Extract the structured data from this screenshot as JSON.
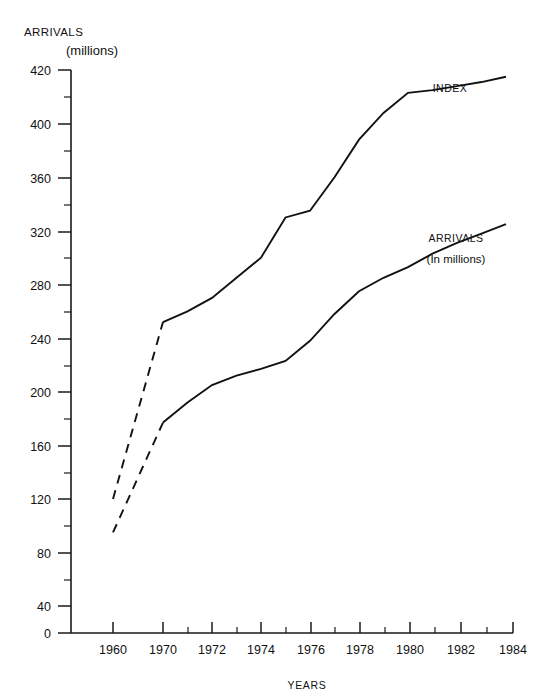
{
  "chart_data": {
    "type": "line",
    "title": "ARRIVALS",
    "subtitle": "(millions)",
    "xlabel": "YEARS",
    "ylabel": "",
    "ylim": [
      0,
      420
    ],
    "grid": false,
    "legend_position": "inline-annotation",
    "y_ticks_major": [
      0,
      40,
      80,
      120,
      160,
      200,
      240,
      280,
      320,
      360,
      400,
      420
    ],
    "y_ticks_minor": [
      20,
      60,
      100,
      140,
      180,
      220,
      260,
      300,
      340,
      380
    ],
    "x_ticks_major": [
      1960,
      1970,
      1972,
      1974,
      1976,
      1978,
      1980,
      1982,
      1984
    ],
    "x_ticks_minor": [
      1971,
      1973,
      1975,
      1977,
      1979,
      1981,
      1983
    ],
    "x_axis_note": "broken axis between 1960 and 1970",
    "series": [
      {
        "name": "INDEX",
        "label": "INDEX",
        "sublabel": "",
        "style": "solid-with-dashed-head",
        "x": [
          1960,
          1970,
          1971,
          1972,
          1973,
          1974,
          1975,
          1976,
          1977,
          1978,
          1979,
          1980,
          1981,
          1982,
          1983,
          1984
        ],
        "values": [
          100,
          232,
          240,
          250,
          265,
          280,
          310,
          315,
          340,
          368,
          388,
          403,
          405,
          408,
          411,
          415
        ],
        "dashed_through": 1970
      },
      {
        "name": "ARRIVALS",
        "label": "ARRIVALS",
        "sublabel": "(In millions)",
        "style": "solid-with-dashed-head",
        "x": [
          1960,
          1970,
          1971,
          1972,
          1973,
          1974,
          1975,
          1976,
          1977,
          1978,
          1979,
          1980,
          1981,
          1982,
          1983,
          1984
        ],
        "values": [
          75,
          157,
          172,
          185,
          192,
          197,
          203,
          218,
          238,
          255,
          265,
          273,
          283,
          291,
          298,
          305
        ],
        "dashed_through": 1970
      }
    ],
    "annotations": [
      {
        "text": "INDEX",
        "x": 1981,
        "y": 418
      },
      {
        "text": "ARRIVALS",
        "x": 1981.4,
        "y": 312
      },
      {
        "text": "(In millions)",
        "x": 1981.4,
        "y": 295
      }
    ],
    "colors": {
      "line": "#111111",
      "axis": "#1a1a1a",
      "background": "#ffffff"
    }
  },
  "labels": {
    "axis_title_main": "ARRIVALS",
    "axis_title_sub": "(millions)",
    "x_axis_title": "YEARS",
    "index_label": "INDEX",
    "arrivals_label": "ARRIVALS",
    "arrivals_sublabel": "(In millions)"
  },
  "y_tick_text": {
    "t420": "420",
    "t400": "400",
    "t360": "360",
    "t320": "320",
    "t280": "280",
    "t240": "240",
    "t200": "200",
    "t160": "160",
    "t120": "120",
    "t80": "80",
    "t40": "40",
    "t0": "0"
  },
  "x_tick_text": {
    "t1960": "1960",
    "t1970": "1970",
    "t1972": "1972",
    "t1974": "1974",
    "t1976": "1976",
    "t1978": "1978",
    "t1980": "1980",
    "t1982": "1982",
    "t1984": "1984"
  }
}
